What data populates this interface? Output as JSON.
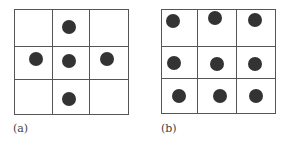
{
  "panels": [
    {
      "label": "(a)",
      "grid": {
        "left": 14,
        "top": 9,
        "width": 115,
        "height": 106,
        "cols_x": [
          37,
          74
        ],
        "rows_y": [
          36,
          69
        ]
      },
      "dots": [
        {
          "x": 69,
          "y": 27
        },
        {
          "x": 36,
          "y": 59
        },
        {
          "x": 69,
          "y": 61
        },
        {
          "x": 107,
          "y": 59
        },
        {
          "x": 69,
          "y": 99
        }
      ],
      "label_pos": {
        "x": 13,
        "y": 122
      }
    },
    {
      "label": "(b)",
      "grid": {
        "left": 161,
        "top": 9,
        "width": 115,
        "height": 105,
        "cols_x": [
          35,
          74
        ],
        "rows_y": [
          36,
          68
        ]
      },
      "dots": [
        {
          "x": 173,
          "y": 21
        },
        {
          "x": 215,
          "y": 18
        },
        {
          "x": 255,
          "y": 20
        },
        {
          "x": 174,
          "y": 63
        },
        {
          "x": 217,
          "y": 64
        },
        {
          "x": 255,
          "y": 64
        },
        {
          "x": 179,
          "y": 96
        },
        {
          "x": 220,
          "y": 96
        },
        {
          "x": 256,
          "y": 96
        }
      ],
      "label_pos": {
        "x": 161,
        "y": 122
      }
    }
  ],
  "dot_radius": 7,
  "colors": {
    "line": "#555555",
    "dot": "#333333",
    "label": "#444444"
  }
}
